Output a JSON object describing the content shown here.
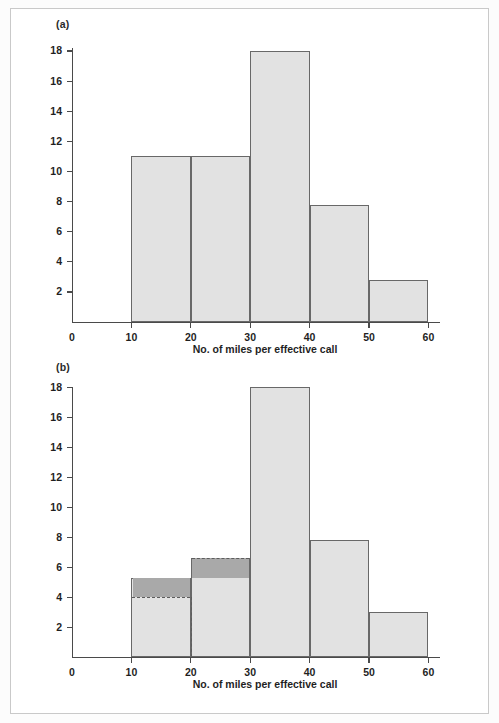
{
  "figure": {
    "panels": [
      {
        "key": "a",
        "label": "(a)",
        "axis_title": "No. of miles per effective call"
      },
      {
        "key": "b",
        "label": "(b)",
        "axis_title": "No. of miles per effective call"
      }
    ],
    "colors": {
      "bar_fill": "#e2e2e2",
      "bar_edge": "#686868",
      "overlay_fill": "#a9a9a9",
      "dash": "#5d5d5d",
      "axis": "#4a4a4a",
      "page_border": "#c9c9c9"
    }
  },
  "chart_data": [
    {
      "type": "bar",
      "panel": "(a)",
      "title": "",
      "xlabel": "No. of miles per effective call",
      "ylabel": "",
      "xlim": [
        0,
        60
      ],
      "ylim": [
        0,
        18
      ],
      "xticks": [
        0,
        10,
        20,
        30,
        40,
        50,
        60
      ],
      "yticks": [
        2,
        4,
        6,
        8,
        10,
        12,
        14,
        16,
        18
      ],
      "grid": false,
      "legend": "none",
      "bins": [
        {
          "x0": 10,
          "x1": 20,
          "height": 11.0
        },
        {
          "x0": 20,
          "x1": 30,
          "height": 11.0
        },
        {
          "x0": 30,
          "x1": 40,
          "height": 18.0
        },
        {
          "x0": 40,
          "x1": 50,
          "height": 7.8
        },
        {
          "x0": 50,
          "x1": 60,
          "height": 2.8
        }
      ],
      "categories": [
        "10-20",
        "20-30",
        "30-40",
        "40-50",
        "50-60"
      ],
      "values": [
        11.0,
        11.0,
        18.0,
        7.8,
        2.8
      ]
    },
    {
      "type": "bar",
      "panel": "(b)",
      "title": "",
      "xlabel": "No. of miles per effective call",
      "ylabel": "",
      "xlim": [
        0,
        60
      ],
      "ylim": [
        0,
        18
      ],
      "xticks": [
        0,
        10,
        20,
        30,
        40,
        50,
        60
      ],
      "yticks": [
        2,
        4,
        6,
        8,
        10,
        12,
        14,
        16,
        18
      ],
      "grid": false,
      "legend": "none",
      "bins": [
        {
          "x0": 10,
          "x1": 20,
          "height": 5.3,
          "original_height": 4.0,
          "overlay_from": 4.0,
          "overlay_to": 5.3
        },
        {
          "x0": 20,
          "x1": 30,
          "height": 6.6,
          "original_height": 5.25,
          "overlay_from": 5.25,
          "overlay_to": 6.6
        },
        {
          "x0": 30,
          "x1": 40,
          "height": 18.0
        },
        {
          "x0": 40,
          "x1": 50,
          "height": 7.8
        },
        {
          "x0": 50,
          "x1": 60,
          "height": 3.0
        }
      ],
      "categories": [
        "10-20",
        "20-30",
        "30-40",
        "40-50",
        "50-60"
      ],
      "values": [
        5.3,
        6.6,
        18.0,
        7.8,
        3.0
      ],
      "annotations": [
        {
          "kind": "dashed-vertical",
          "x": 20,
          "y0": 0,
          "y1": 4.0
        },
        {
          "kind": "dashed-horizontal",
          "x0": 10,
          "x1": 20,
          "y": 4.0
        },
        {
          "kind": "dashed-horizontal",
          "x0": 20,
          "x1": 30,
          "y": 6.6
        }
      ]
    }
  ],
  "axis_labels": {
    "y": [
      "18",
      "16",
      "14",
      "12",
      "10",
      "8",
      "6",
      "4",
      "2"
    ],
    "x": [
      "0",
      "10",
      "20",
      "30",
      "40",
      "50",
      "60"
    ]
  }
}
